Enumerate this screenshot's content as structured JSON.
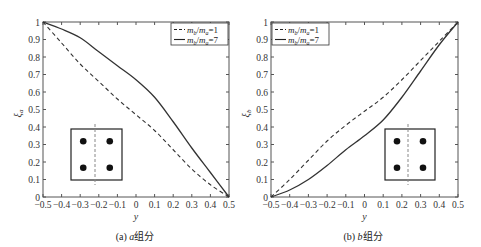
{
  "chart_data": [
    {
      "type": "line",
      "panel": "a",
      "caption": "(a) a组分",
      "xlabel": "y",
      "ylabel": "ξa",
      "xlim": [
        -0.5,
        0.5
      ],
      "ylim": [
        0,
        1
      ],
      "xticks": [
        "-0.5",
        "-0.4",
        "-0.3",
        "-0.2",
        "-0.1",
        "0",
        "0.1",
        "0.2",
        "0.3",
        "0.4",
        "0.5"
      ],
      "yticks": [
        "0",
        "0.1",
        "0.2",
        "0.3",
        "0.4",
        "0.5",
        "0.6",
        "0.7",
        "0.8",
        "0.9",
        "1"
      ],
      "grid": false,
      "legend_position": "upper right",
      "x": [
        -0.5,
        -0.4,
        -0.3,
        -0.2,
        -0.1,
        0,
        0.1,
        0.2,
        0.3,
        0.4,
        0.5
      ],
      "series": [
        {
          "name": "m_b/m_a=1",
          "style": "dashed",
          "values": [
            1,
            0.88,
            0.76,
            0.66,
            0.56,
            0.47,
            0.38,
            0.27,
            0.16,
            0.07,
            0
          ]
        },
        {
          "name": "m_b/m_a=7",
          "style": "solid",
          "values": [
            1,
            0.96,
            0.91,
            0.83,
            0.75,
            0.67,
            0.57,
            0.43,
            0.28,
            0.14,
            0
          ]
        }
      ],
      "inset": {
        "description": "square cross-section with 4 dots, dashed vertical line left of center",
        "position": "lower left"
      }
    },
    {
      "type": "line",
      "panel": "b",
      "caption": "(b) b组分",
      "xlabel": "y",
      "ylabel": "ξb",
      "xlim": [
        -0.5,
        0.5
      ],
      "ylim": [
        0,
        1
      ],
      "xticks": [
        "-0.5",
        "-0.4",
        "-0.3",
        "-0.2",
        "-0.1",
        "0",
        "0.1",
        "0.2",
        "0.3",
        "0.4",
        "0.5"
      ],
      "yticks": [
        "0",
        "0.1",
        "0.2",
        "0.3",
        "0.4",
        "0.5",
        "0.6",
        "0.7",
        "0.8",
        "0.9",
        "1"
      ],
      "grid": false,
      "legend_position": "upper left",
      "x": [
        -0.5,
        -0.4,
        -0.3,
        -0.2,
        -0.1,
        0,
        0.1,
        0.2,
        0.3,
        0.4,
        0.5
      ],
      "series": [
        {
          "name": "m_b/m_a=1",
          "style": "dashed",
          "values": [
            0,
            0.1,
            0.21,
            0.32,
            0.41,
            0.49,
            0.57,
            0.67,
            0.78,
            0.89,
            1
          ]
        },
        {
          "name": "m_b/m_a=7",
          "style": "solid",
          "values": [
            0,
            0.04,
            0.1,
            0.18,
            0.27,
            0.35,
            0.44,
            0.57,
            0.72,
            0.87,
            1
          ]
        }
      ],
      "inset": {
        "description": "square cross-section with 4 dots, dashed vertical line right of center",
        "position": "lower right"
      }
    }
  ],
  "panels": {
    "a": {
      "caption_prefix": "(a) ",
      "caption_var": "a",
      "caption_suffix": "组分",
      "ylabel_sym": "ξ",
      "ylabel_sub": "a",
      "xlabel": "y"
    },
    "b": {
      "caption_prefix": "(b) ",
      "caption_var": "b",
      "caption_suffix": "组分",
      "ylabel_sym": "ξ",
      "ylabel_sub": "b",
      "xlabel": "y"
    }
  },
  "legend": {
    "item1": {
      "num": "m",
      "num_sub": "b",
      "slash": "/",
      "den": "m",
      "den_sub": "a",
      "eq": "=1"
    },
    "item2": {
      "num": "m",
      "num_sub": "b",
      "slash": "/",
      "den": "m",
      "den_sub": "a",
      "eq": "=7"
    }
  },
  "colors": {
    "line": "#333333",
    "axis": "#555555",
    "inset_dash": "#888888"
  }
}
